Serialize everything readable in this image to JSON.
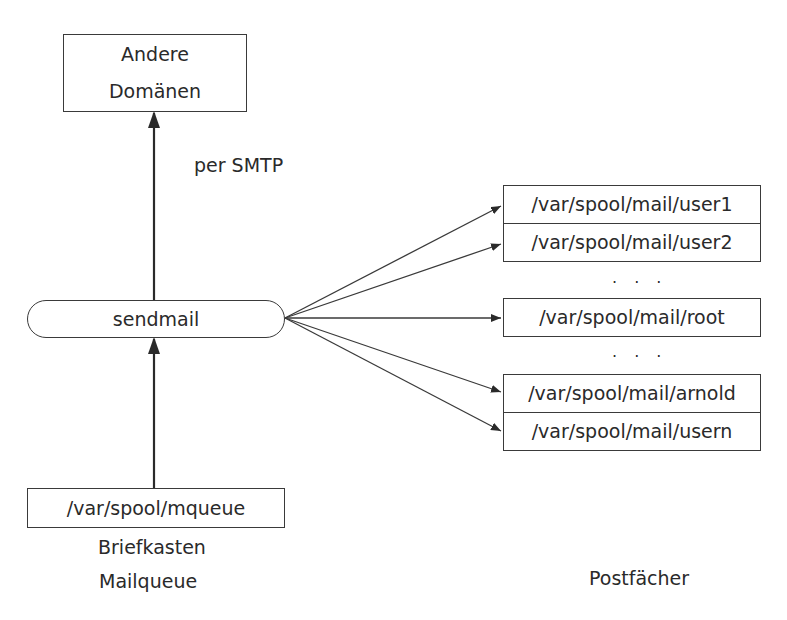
{
  "diagram": {
    "nodes": {
      "other_domains": {
        "line1": "Andere",
        "line2": "Domänen"
      },
      "sendmail": {
        "label": "sendmail"
      },
      "mqueue": {
        "label": "/var/spool/mqueue"
      }
    },
    "edges": {
      "smtp_label": "per SMTP"
    },
    "mailboxes": [
      {
        "label": "/var/spool/mail/user1"
      },
      {
        "label": "/var/spool/mail/user2"
      },
      {
        "label": "/var/spool/mail/root"
      },
      {
        "label": "/var/spool/mail/arnold"
      },
      {
        "label": "/var/spool/mail/usern"
      }
    ],
    "ellipsis": ". . .",
    "captions": {
      "briefkasten": "Briefkasten",
      "mailqueue": "Mailqueue",
      "postfaecher": "Postfächer"
    }
  }
}
